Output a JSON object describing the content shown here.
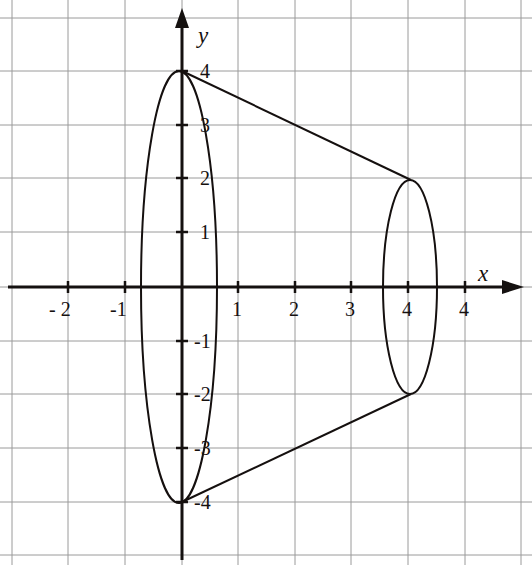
{
  "figure": {
    "width": 532,
    "height": 565,
    "background": "#ffffff"
  },
  "axes": {
    "x_axis_label": "x",
    "y_axis_label": "y",
    "x_label_pos": {
      "x": 478,
      "y": 262
    },
    "y_label_pos": {
      "x": 198,
      "y": 24
    },
    "origin_px": {
      "x": 182,
      "y": 287
    },
    "unit_px": {
      "x": 56.5,
      "y": 53.5
    },
    "axis_color": "#151110",
    "axis_width": 3
  },
  "grid": {
    "color": "#9a9a9a",
    "width": 1,
    "vertical_px": [
      12,
      68,
      125,
      182,
      238,
      295,
      351,
      408,
      465,
      521
    ],
    "horizontal_px": [
      18,
      71,
      125,
      178,
      232,
      287,
      341,
      394,
      448,
      502,
      555
    ]
  },
  "x_ticks": [
    {
      "label": "- 2",
      "value": -2,
      "px": 68,
      "label_x": 49,
      "label_y": 299
    },
    {
      "label": "-1",
      "value": -1,
      "px": 125,
      "label_x": 110,
      "label_y": 299
    },
    {
      "label": "1",
      "value": 1,
      "px": 238,
      "label_x": 232,
      "label_y": 299
    },
    {
      "label": "2",
      "value": 2,
      "px": 295,
      "label_x": 289,
      "label_y": 299
    },
    {
      "label": "3",
      "value": 3,
      "px": 351,
      "label_x": 345,
      "label_y": 299
    },
    {
      "label": "4",
      "value": 4,
      "px": 408,
      "label_x": 402,
      "label_y": 299
    },
    {
      "label": "4",
      "value": 5,
      "px": 465,
      "label_x": 459,
      "label_y": 299
    }
  ],
  "y_ticks": [
    {
      "label": "4",
      "value": 4,
      "px": 71,
      "label_x": 200,
      "label_y": 61
    },
    {
      "label": "3",
      "value": 3,
      "px": 125,
      "label_x": 200,
      "label_y": 115
    },
    {
      "label": "2",
      "value": 2,
      "px": 178,
      "label_x": 200,
      "label_y": 168
    },
    {
      "label": "1",
      "value": 1,
      "px": 232,
      "label_x": 200,
      "label_y": 222
    },
    {
      "label": "-1",
      "value": -1,
      "px": 341,
      "label_x": 194,
      "label_y": 331
    },
    {
      "label": "-2",
      "value": -2,
      "px": 394,
      "label_x": 194,
      "label_y": 384
    },
    {
      "label": "-3",
      "value": -3,
      "px": 448,
      "label_x": 194,
      "label_y": 438
    },
    {
      "label": "-4",
      "value": -4,
      "px": 502,
      "label_x": 194,
      "label_y": 492
    }
  ],
  "chart_data": {
    "type": "line",
    "title": "",
    "xlabel": "x",
    "ylabel": "y",
    "xlim": [
      -3,
      6
    ],
    "ylim": [
      -5,
      5
    ],
    "grid": true,
    "legend": null,
    "curve_color": "#15100f",
    "curve_width": 2,
    "shapes": [
      {
        "name": "left-ellipse",
        "type": "ellipse",
        "center": [
          0,
          0
        ],
        "rx_data": 0.67,
        "ry_data": 4.0,
        "center_px": [
          179,
          287
        ],
        "rx_px": 38,
        "ry_px": 216
      },
      {
        "name": "right-ellipse",
        "type": "ellipse",
        "center": [
          4,
          0
        ],
        "rx_data": 0.48,
        "ry_data": 2.0,
        "center_px": [
          410,
          287
        ],
        "rx_px": 27,
        "ry_px": 107
      },
      {
        "name": "upper-slant-line",
        "type": "line",
        "from": [
          0,
          4
        ],
        "to": [
          4,
          2
        ],
        "from_px": [
          182,
          71
        ],
        "to_px": [
          411,
          180
        ]
      },
      {
        "name": "lower-slant-line",
        "type": "line",
        "from": [
          0,
          -4
        ],
        "to": [
          4,
          -2
        ],
        "from_px": [
          182,
          502
        ],
        "to_px": [
          411,
          394
        ]
      }
    ],
    "key_points": [
      {
        "label": "top-vertex",
        "x": 0,
        "y": 4
      },
      {
        "label": "bottom-vertex",
        "x": 0,
        "y": -4
      },
      {
        "label": "right-top",
        "x": 4,
        "y": 2
      },
      {
        "label": "right-bottom",
        "x": 4,
        "y": -2
      }
    ]
  }
}
